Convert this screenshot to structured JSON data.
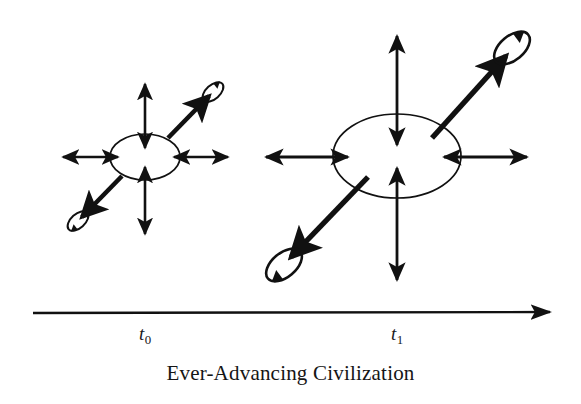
{
  "figure": {
    "caption": "Ever-Advancing Civilization",
    "background_color": "#ffffff",
    "ink_color": "#111111",
    "axis": {
      "label_t0": "t",
      "label_t0_sub": "0",
      "label_t1": "t",
      "label_t1_sub": "1",
      "direction": "left-to-right",
      "arrowhead": "right"
    },
    "stages": [
      {
        "name": "t0",
        "title": "t₀",
        "description": "Smaller central ellipse with four outward double-headed arrows and two diagonal expansion arrows ending in rotating satellite loops",
        "core_ellipse": {
          "cx": 145,
          "cy": 157,
          "rx": 35,
          "ry": 23
        },
        "radial_arrows": 4,
        "diagonal_arrows": 2,
        "satellites": 2
      },
      {
        "name": "t1",
        "title": "t₁",
        "description": "Larger central ellipse with four outward double-headed arrows and two diagonal expansion arrows ending in rotating satellite loops",
        "core_ellipse": {
          "cx": 397,
          "cy": 156,
          "rx": 64,
          "ry": 42
        },
        "radial_arrows": 4,
        "diagonal_arrows": 2,
        "satellites": 2
      }
    ]
  }
}
